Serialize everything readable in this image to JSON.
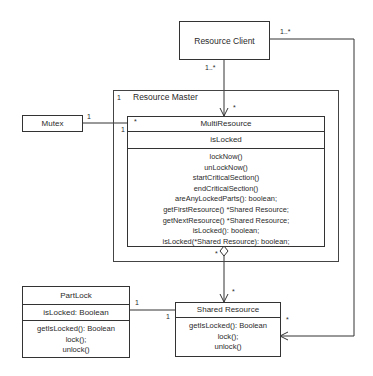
{
  "diagram": {
    "type": "UML class diagram",
    "classes": {
      "resource_client": {
        "name": "Resource Client"
      },
      "resource_master": {
        "name": "Resource Master",
        "multiplicity": "1"
      },
      "mutex": {
        "name": "Mutex"
      },
      "multi_resource": {
        "name": "MultiResource",
        "multiplicity": "*",
        "attributes": [
          "isLocked"
        ],
        "operations": [
          "lockNow()",
          "unLockNow()",
          "startCriticalSection()",
          "endCriticalSection()",
          "areAnyLockedParts(): boolean;",
          "getFirstResource() *Shared Resource;",
          "getNextResource() *Shared Resource;",
          "isLocked(): boolean;",
          "isLocked(*Shared Resource): boolean;"
        ]
      },
      "part_lock": {
        "name": "PartLock",
        "attributes": [
          "isLocked: Boolean"
        ],
        "operations": [
          "getIsLocked(): Boolean",
          "lock();",
          "unlock()"
        ]
      },
      "shared_resource": {
        "name": "Shared Resource",
        "operations": [
          "getIsLocked(): Boolean",
          "lock();",
          "unlock()"
        ]
      }
    },
    "multiplicities": {
      "client_to_multi_src": "1..*",
      "client_to_multi_dst": "*",
      "client_to_shared_src": "1..*",
      "client_to_shared_dst": "*",
      "mutex_end": "1",
      "mutex_multi_end": "1",
      "multi_to_shared_src": "*",
      "multi_to_shared_dst": "*",
      "partlock_end": "1",
      "shared_partlock_end": "1"
    }
  }
}
